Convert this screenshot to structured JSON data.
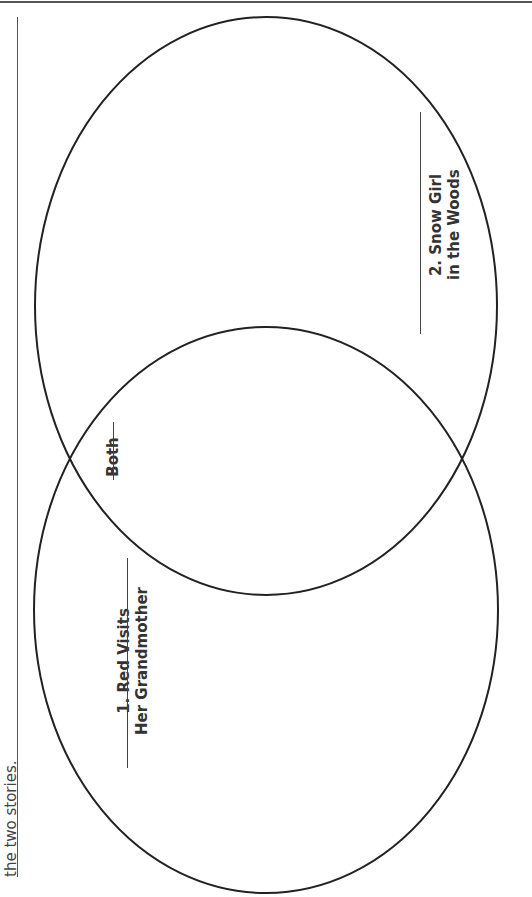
{
  "instruction": {
    "text": "the two stories."
  },
  "venn": {
    "circle1": {
      "number": "1.",
      "label_line1": "1. Red Visits",
      "label_line2": "Her Grandmother"
    },
    "circle2": {
      "number": "2.",
      "label_line1": "2. Snow Girl",
      "label_line2": "in the Woods"
    },
    "overlap": {
      "label": "Both"
    }
  },
  "colors": {
    "stroke": "#222222",
    "text": "#333333"
  }
}
